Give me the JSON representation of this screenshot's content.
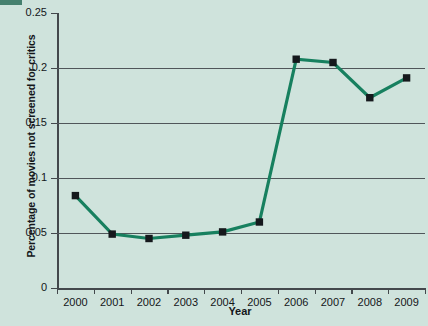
{
  "chart_data": {
    "type": "line",
    "title": "",
    "xlabel": "Year",
    "ylabel": "Percentage of movies not screened for critics",
    "categories": [
      "2000",
      "2001",
      "2002",
      "2003",
      "2004",
      "2005",
      "2006",
      "2007",
      "2008",
      "2009"
    ],
    "values": [
      0.084,
      0.049,
      0.045,
      0.048,
      0.051,
      0.06,
      0.208,
      0.205,
      0.173,
      0.191
    ],
    "series": [
      {
        "name": "Percentage of movies not screened for critics",
        "values": [
          0.084,
          0.049,
          0.045,
          0.048,
          0.051,
          0.06,
          0.208,
          0.205,
          0.173,
          0.191
        ]
      }
    ],
    "ylim": [
      0,
      0.25
    ],
    "ytick_labels": [
      "0",
      "0.05",
      "0.1",
      "0.15",
      "0.2",
      "0.25"
    ],
    "ytick_values": [
      0,
      0.05,
      0.1,
      0.15,
      0.2,
      0.25
    ],
    "grid": "horizontal",
    "legend": "none",
    "line_color": "#17805f",
    "marker_color": "#15181c",
    "marker_shape": "square",
    "background_color": "#cfe3dc"
  }
}
